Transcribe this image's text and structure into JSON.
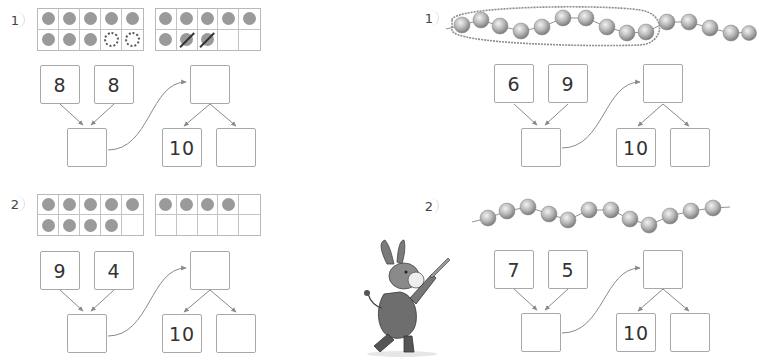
{
  "problems": [
    {
      "id": "left-1",
      "number": "1",
      "representation": "ten-frames",
      "frame1": [
        "dot",
        "dot",
        "dot",
        "dot",
        "dot",
        "dot",
        "dot",
        "dot",
        "ring",
        "ring"
      ],
      "frame2": [
        "dot",
        "dot",
        "dot",
        "dot",
        "dot",
        "dot",
        "crossed",
        "crossed",
        "empty",
        "empty"
      ],
      "addend1": "8",
      "addend2": "8",
      "sum": "",
      "decomp_top": "",
      "decomp_left": "10",
      "decomp_right": ""
    },
    {
      "id": "left-2",
      "number": "2",
      "representation": "ten-frames",
      "frame1": [
        "dot",
        "dot",
        "dot",
        "dot",
        "dot",
        "dot",
        "dot",
        "dot",
        "dot",
        "empty"
      ],
      "frame2": [
        "dot",
        "dot",
        "dot",
        "dot",
        "empty",
        "empty",
        "empty",
        "empty",
        "empty",
        "empty"
      ],
      "addend1": "9",
      "addend2": "4",
      "sum": "",
      "decomp_top": "",
      "decomp_left": "10",
      "decomp_right": ""
    },
    {
      "id": "right-1",
      "number": "1",
      "representation": "bead-string",
      "bead_count": 15,
      "circled_beads": 10,
      "addend1": "6",
      "addend2": "9",
      "sum": "",
      "decomp_top": "",
      "decomp_left": "10",
      "decomp_right": ""
    },
    {
      "id": "right-2",
      "number": "2",
      "representation": "bead-string",
      "bead_count": 12,
      "circled_beads": 0,
      "addend1": "7",
      "addend2": "5",
      "sum": "",
      "decomp_top": "",
      "decomp_left": "10",
      "decomp_right": ""
    }
  ],
  "illustration": {
    "name": "donkey-mascot-with-pencil"
  },
  "colors": {
    "box_border": "#a8a8a8",
    "dot": "#9a9a9a",
    "bead": "#b5b5b5",
    "arrow": "#8a8a8a"
  }
}
